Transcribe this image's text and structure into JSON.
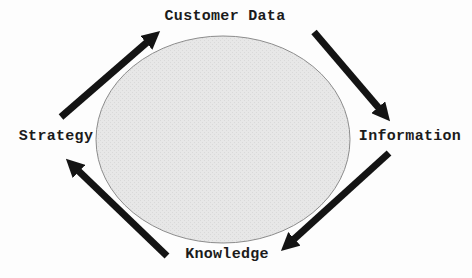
{
  "colors": {
    "background": "#fdfdfd",
    "arrow": "#141414",
    "ellipse_fill": "#e7e7e7",
    "ellipse_dot": "#d9d9d9",
    "ellipse_stroke": "#8c8c8c",
    "label_text": "#1b1b1b"
  },
  "cycle": {
    "nodes": [
      {
        "label": "Customer Data",
        "position": "top"
      },
      {
        "label": "Information",
        "position": "right"
      },
      {
        "label": "Knowledge",
        "position": "bottom"
      },
      {
        "label": "Strategy",
        "position": "left"
      }
    ],
    "flow": [
      {
        "from": "Strategy",
        "to": "Customer Data"
      },
      {
        "from": "Customer Data",
        "to": "Information"
      },
      {
        "from": "Information",
        "to": "Knowledge"
      },
      {
        "from": "Knowledge",
        "to": "Strategy"
      }
    ]
  }
}
